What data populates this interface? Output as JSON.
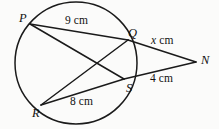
{
  "figure": {
    "kind": "circle-geometry-diagram",
    "stroke_color": "#1a1a1a",
    "background_color": "#fbfbfa"
  },
  "vertices": [
    {
      "id": "P",
      "label": "P",
      "x": 30,
      "y": 24,
      "on_circle": true
    },
    {
      "id": "Q",
      "label": "Q",
      "x": 128,
      "y": 40,
      "on_circle": true
    },
    {
      "id": "S",
      "label": "S",
      "x": 124,
      "y": 79,
      "on_circle": true
    },
    {
      "id": "R",
      "label": "R",
      "x": 41,
      "y": 105,
      "on_circle": true
    },
    {
      "id": "N",
      "label": "N",
      "x": 196,
      "y": 62,
      "on_circle": false
    }
  ],
  "circle": {
    "cx": 76,
    "cy": 63,
    "r": 61
  },
  "segments": [
    {
      "id": "PQ",
      "from": "P",
      "to": "Q",
      "measure": "9 cm"
    },
    {
      "id": "PS",
      "from": "P",
      "to": "S",
      "measure": ""
    },
    {
      "id": "QR",
      "from": "Q",
      "to": "R",
      "measure": ""
    },
    {
      "id": "RS",
      "from": "R",
      "to": "S",
      "measure": "8 cm"
    },
    {
      "id": "QN",
      "from": "Q",
      "to": "N",
      "measure": "x cm"
    },
    {
      "id": "SN",
      "from": "S",
      "to": "N",
      "measure": "4 cm"
    }
  ],
  "measures": {
    "pq": "9 cm",
    "rs": "8 cm",
    "sn": "4 cm",
    "qn_variable": "x",
    "qn_unit": "cm"
  }
}
